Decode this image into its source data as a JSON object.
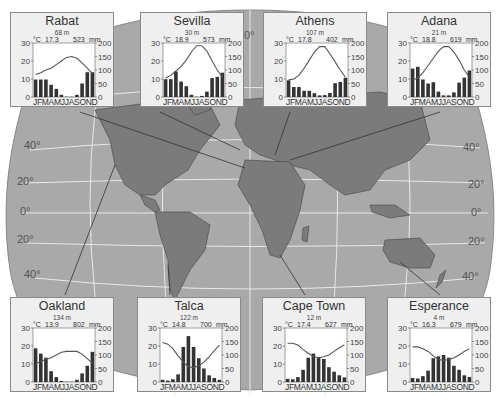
{
  "map": {
    "ocean_color": "#a9a9a9",
    "land_color": "#7b7b7b",
    "graticule_color": "#ffffff",
    "top_label": "0°",
    "lat_labels_left": [
      "40°",
      "20°",
      "0°",
      "20°",
      "40°"
    ],
    "lat_labels_right": [
      "40°",
      "20°",
      "0°",
      "20°",
      "40°"
    ]
  },
  "chart_data": [
    {
      "type": "bar+line",
      "station": "Rabat",
      "elevation": "68 m",
      "mean_temp": "17.3",
      "annual_precip": "523",
      "temp_unit": "°C",
      "precip_unit": "mm",
      "ylim_temp": [
        0,
        30
      ],
      "ylim_precip": [
        0,
        200
      ],
      "temp_ticks": [
        "30",
        "20",
        "10",
        "0"
      ],
      "precip_ticks": [
        "200",
        "150",
        "100",
        "50",
        "0"
      ],
      "categories": [
        "J",
        "F",
        "M",
        "A",
        "M",
        "J",
        "J",
        "A",
        "S",
        "O",
        "N",
        "D"
      ],
      "precip": [
        65,
        65,
        65,
        45,
        30,
        8,
        1,
        1,
        8,
        50,
        92,
        92
      ],
      "temp": [
        12.5,
        13.5,
        15,
        16,
        18,
        20,
        22,
        22.5,
        21.5,
        19,
        16,
        13
      ]
    },
    {
      "type": "bar+line",
      "station": "Sevilla",
      "elevation": "30 m",
      "mean_temp": "18.9",
      "annual_precip": "573",
      "temp_unit": "°C",
      "precip_unit": "mm",
      "ylim_temp": [
        0,
        30
      ],
      "ylim_precip": [
        0,
        200
      ],
      "temp_ticks": [
        "30",
        "20",
        "10",
        "0"
      ],
      "precip_ticks": [
        "200",
        "150",
        "100",
        "50",
        "0"
      ],
      "categories": [
        "J",
        "F",
        "M",
        "A",
        "M",
        "J",
        "J",
        "A",
        "S",
        "O",
        "N",
        "D"
      ],
      "precip": [
        66,
        66,
        95,
        57,
        40,
        8,
        1,
        4,
        20,
        70,
        75,
        90
      ],
      "temp": [
        10.5,
        12,
        14.5,
        17,
        20.5,
        25,
        28.5,
        28.5,
        25.5,
        20,
        15,
        11
      ]
    },
    {
      "type": "bar+line",
      "station": "Athens",
      "elevation": "107 m",
      "mean_temp": "17.8",
      "annual_precip": "402",
      "temp_unit": "°C",
      "precip_unit": "mm",
      "ylim_temp": [
        0,
        30
      ],
      "ylim_precip": [
        0,
        200
      ],
      "temp_ticks": [
        "30",
        "20",
        "10",
        "0"
      ],
      "precip_ticks": [
        "200",
        "150",
        "100",
        "50",
        "0"
      ],
      "categories": [
        "J",
        "F",
        "M",
        "A",
        "M",
        "J",
        "J",
        "A",
        "S",
        "O",
        "N",
        "D"
      ],
      "precip": [
        62,
        37,
        37,
        23,
        23,
        14,
        6,
        7,
        15,
        51,
        56,
        71
      ],
      "temp": [
        9.5,
        10,
        12,
        16,
        20.5,
        25,
        28,
        28,
        24,
        19.5,
        15,
        11
      ]
    },
    {
      "type": "bar+line",
      "station": "Adana",
      "elevation": "21 m",
      "mean_temp": "18.8",
      "annual_precip": "619",
      "temp_unit": "°C",
      "precip_unit": "mm",
      "ylim_temp": [
        0,
        30
      ],
      "ylim_precip": [
        0,
        200
      ],
      "temp_ticks": [
        "30",
        "20",
        "10",
        "0"
      ],
      "precip_ticks": [
        "200",
        "150",
        "100",
        "50",
        "0"
      ],
      "categories": [
        "J",
        "F",
        "M",
        "A",
        "M",
        "J",
        "J",
        "A",
        "S",
        "O",
        "N",
        "D"
      ],
      "precip": [
        105,
        112,
        65,
        50,
        55,
        20,
        6,
        6,
        17,
        53,
        72,
        98
      ],
      "temp": [
        9.5,
        10.5,
        13.5,
        17.5,
        21.5,
        25.5,
        28,
        28,
        25,
        20.5,
        15,
        11
      ]
    },
    {
      "type": "bar+line",
      "station": "Oakland",
      "elevation": "134 m",
      "mean_temp": "13.9",
      "annual_precip": "802",
      "temp_unit": "°C",
      "precip_unit": "mm",
      "ylim_temp": [
        0,
        30
      ],
      "ylim_precip": [
        0,
        200
      ],
      "temp_ticks": [
        "30",
        "20",
        "10",
        "0"
      ],
      "precip_ticks": [
        "200",
        "150",
        "100",
        "50",
        "0"
      ],
      "categories": [
        "J",
        "F",
        "M",
        "A",
        "M",
        "J",
        "J",
        "A",
        "S",
        "O",
        "N",
        "D"
      ],
      "precip": [
        125,
        105,
        90,
        40,
        18,
        4,
        1,
        1,
        8,
        32,
        60,
        112
      ],
      "temp": [
        10,
        11.5,
        12.5,
        13.5,
        15,
        16.5,
        17,
        17,
        17,
        15.5,
        13,
        10.5
      ]
    },
    {
      "type": "bar+line",
      "station": "Talca",
      "elevation": "122 m",
      "mean_temp": "14.8",
      "annual_precip": "700",
      "temp_unit": "°C",
      "precip_unit": "mm",
      "ylim_temp": [
        0,
        30
      ],
      "ylim_precip": [
        0,
        200
      ],
      "temp_ticks": [
        "30",
        "20",
        "10",
        "0"
      ],
      "precip_ticks": [
        "200",
        "150",
        "100",
        "50",
        "0"
      ],
      "categories": [
        "J",
        "F",
        "M",
        "A",
        "M",
        "J",
        "J",
        "A",
        "S",
        "O",
        "N",
        "D"
      ],
      "precip": [
        8,
        5,
        10,
        28,
        130,
        170,
        130,
        88,
        50,
        25,
        15,
        8
      ],
      "temp": [
        22,
        21,
        18.5,
        14.5,
        11,
        8.5,
        8,
        9,
        11,
        14,
        17.5,
        20.5
      ]
    },
    {
      "type": "bar+line",
      "station": "Cape Town",
      "elevation": "12 m",
      "mean_temp": "17.4",
      "annual_precip": "627",
      "temp_unit": "°C",
      "precip_unit": "mm",
      "ylim_temp": [
        0,
        30
      ],
      "ylim_precip": [
        0,
        200
      ],
      "temp_ticks": [
        "30",
        "20",
        "10",
        "0"
      ],
      "precip_ticks": [
        "200",
        "150",
        "100",
        "50",
        "0"
      ],
      "categories": [
        "J",
        "F",
        "M",
        "A",
        "M",
        "J",
        "J",
        "A",
        "S",
        "O",
        "N",
        "D"
      ],
      "precip": [
        12,
        10,
        18,
        45,
        90,
        105,
        90,
        85,
        55,
        38,
        25,
        17
      ],
      "temp": [
        21.5,
        21.5,
        20.5,
        18,
        16,
        14,
        13.5,
        14,
        15,
        17,
        19,
        20.5
      ]
    },
    {
      "type": "bar+line",
      "station": "Esperance",
      "elevation": "4 m",
      "mean_temp": "16.3",
      "annual_precip": "679",
      "temp_unit": "°C",
      "precip_unit": "mm",
      "ylim_temp": [
        0,
        30
      ],
      "ylim_precip": [
        0,
        200
      ],
      "temp_ticks": [
        "30",
        "20",
        "10",
        "0"
      ],
      "precip_ticks": [
        "200",
        "150",
        "100",
        "50",
        "0"
      ],
      "categories": [
        "J",
        "F",
        "M",
        "A",
        "M",
        "J",
        "J",
        "A",
        "S",
        "O",
        "N",
        "D"
      ],
      "precip": [
        15,
        13,
        22,
        42,
        88,
        95,
        100,
        90,
        60,
        45,
        25,
        18
      ],
      "temp": [
        19.5,
        19.5,
        18.5,
        17,
        14.5,
        12.5,
        12,
        12.5,
        13.5,
        15,
        17,
        18.5
      ]
    }
  ]
}
